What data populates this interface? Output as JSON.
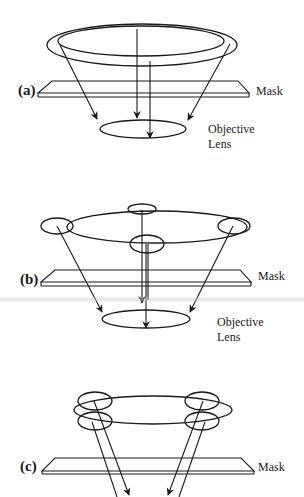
{
  "figure": {
    "stroke_color": "#1a1a1a",
    "background_color": "#ffffff"
  },
  "panels": [
    {
      "id": "a",
      "label": "(a)",
      "mask_label": "Mask",
      "lens_label_line1": "Objective",
      "lens_label_line2": "Lens",
      "source": "annular ring (double-walled)"
    },
    {
      "id": "b",
      "label": "(b)",
      "mask_label": "Mask",
      "lens_label_line1": "Objective",
      "lens_label_line2": "Lens",
      "source": "ring with four small pole apertures"
    },
    {
      "id": "c",
      "label": "(c)",
      "mask_label": "Mask",
      "source": "ring with four off-axis double poles"
    }
  ]
}
